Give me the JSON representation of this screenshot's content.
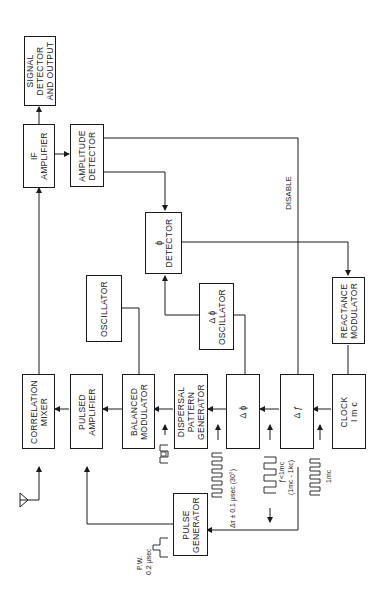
{
  "diagram": {
    "orientation": "rotated-90-ccw",
    "blocks": {
      "signal_detector": {
        "lines": [
          "SIGNAL",
          "DETECTOR",
          "AND  OUTPUT"
        ]
      },
      "if_amplifier": {
        "lines": [
          "IF",
          "AMPLIFIER"
        ]
      },
      "amplitude_detector": {
        "lines": [
          "AMPLITUDE",
          "DETECTOR"
        ]
      },
      "phi_detector": {
        "lines": [
          "ϕ",
          "DETECTOR"
        ]
      },
      "oscillator": {
        "lines": [
          "OSCILLATOR"
        ]
      },
      "delta_phi_oscillator": {
        "lines": [
          "Δ ϕ",
          "OSCILLATOR"
        ]
      },
      "reactance_modulator": {
        "lines": [
          "REACTANCE",
          "MODULATOR"
        ]
      },
      "correlation_mixer": {
        "lines": [
          "CORRELATION",
          "MIXER"
        ]
      },
      "pulsed_amplifier": {
        "lines": [
          "PULSED",
          "AMPLIFIER"
        ]
      },
      "balanced_modulator": {
        "lines": [
          "BALANCED",
          "MODULATOR"
        ]
      },
      "dispersal_pattern_generator": {
        "lines": [
          "DISPERSAL",
          "PATTERN",
          "GENERATOR"
        ]
      },
      "delta_phi": {
        "lines": [
          "Δ ϕ"
        ]
      },
      "delta_f": {
        "lines": [
          "Δ ƒ"
        ]
      },
      "clock": {
        "lines": [
          "CLOCK",
          "I m c"
        ]
      },
      "pulse_generator": {
        "lines": [
          "PULSE",
          "GENERATOR"
        ]
      }
    },
    "labels": {
      "disable": "DISABLE",
      "code_pattern": "⊓⊔⊓⊔",
      "delta_tau": "Δτ ± 0.1 μsec (30°)",
      "f_lt_1mc": "ƒ<1mc",
      "f_range": "(1mc - 1kc)",
      "clock_1mc": "1mc",
      "pw": "P.W.",
      "pw_value": "0.2 μsec"
    }
  }
}
